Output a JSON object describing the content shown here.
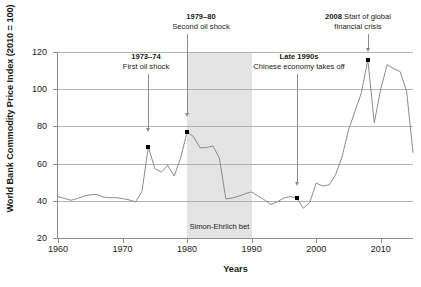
{
  "chart_data": {
    "type": "line",
    "title": "",
    "xlabel": "Years",
    "ylabel": "World Bank Commodity Price Index (2010 = 100)",
    "xlim": [
      1960,
      2015
    ],
    "ylim": [
      20,
      120
    ],
    "xticks": [
      1960,
      1970,
      1980,
      1990,
      2000,
      2010
    ],
    "yticks": [
      20,
      40,
      60,
      80,
      100,
      120
    ],
    "grid": "horizontal",
    "legend": "none",
    "series": [
      {
        "name": "World Bank Commodity Price Index",
        "color": "#8c8c8c",
        "x": [
          1960,
          1961,
          1962,
          1963,
          1964,
          1965,
          1966,
          1967,
          1968,
          1969,
          1970,
          1971,
          1972,
          1973,
          1974,
          1975,
          1976,
          1977,
          1978,
          1979,
          1980,
          1981,
          1982,
          1983,
          1984,
          1985,
          1986,
          1987,
          1988,
          1989,
          1990,
          1991,
          1992,
          1993,
          1994,
          1995,
          1996,
          1997,
          1998,
          1999,
          2000,
          2001,
          2002,
          2003,
          2004,
          2005,
          2006,
          2007,
          2008,
          2009,
          2010,
          2011,
          2012,
          2013,
          2014,
          2015
        ],
        "y": [
          42.2,
          41.3,
          40.3,
          41.2,
          42.5,
          43.3,
          43.4,
          42.0,
          41.6,
          41.7,
          41.2,
          40.5,
          39.4,
          45.0,
          69.0,
          57.3,
          55.5,
          59.0,
          53.3,
          63.0,
          77.0,
          74.5,
          68.5,
          68.6,
          69.5,
          63.0,
          41.0,
          41.5,
          42.5,
          43.8,
          44.8,
          42.5,
          40.5,
          38.0,
          39.5,
          41.5,
          42.3,
          41.5,
          36.0,
          39.0,
          49.5,
          48.0,
          48.5,
          54.0,
          63.5,
          78.0,
          88.0,
          98.0,
          115.8,
          82.0,
          100.0,
          113.2,
          111.0,
          109.5,
          99.0,
          66.0
        ]
      }
    ],
    "markers": [
      {
        "x": 1974,
        "y": 69.0,
        "label": "1973-74 peak"
      },
      {
        "x": 1980,
        "y": 77.0,
        "label": "1979-80 peak"
      },
      {
        "x": 1997,
        "y": 41.5,
        "label": "late 1990s low"
      },
      {
        "x": 2008,
        "y": 115.8,
        "label": "2008 peak"
      }
    ],
    "shaded_regions": [
      {
        "name": "Simon-Ehrlich bet",
        "x_start": 1980,
        "x_end": 1990,
        "color": "#e4e4e4",
        "label": "Simon-Ehrlich bet"
      }
    ],
    "annotations": [
      {
        "id": "first-oil-shock",
        "bold": "1973–74",
        "text": "First oil shock",
        "target_x": 1974,
        "target_y": 77
      },
      {
        "id": "second-oil-shock",
        "bold": "1979–80",
        "text": "Second oil shock",
        "target_x": 1980,
        "target_y": 85
      },
      {
        "id": "chinese-economy",
        "bold": "Late 1990s",
        "text": "Chinese economy takes off",
        "target_x": 1997,
        "target_y": 48
      },
      {
        "id": "financial-crisis",
        "bold": "2008",
        "text": "Start of global financial crisis",
        "target_x": 2008,
        "target_y": 120
      }
    ]
  },
  "axis": {
    "ylabel": "World Bank Commodity Price Index (2010 = 100)",
    "xlabel": "Years",
    "yticks": [
      "120",
      "100",
      "80",
      "60",
      "40",
      "20"
    ],
    "xticks": [
      "1960",
      "1970",
      "1980",
      "1990",
      "2000",
      "2010"
    ]
  },
  "annotations": {
    "first_oil_shock": {
      "bold": "1973–74",
      "text": "First oil shock"
    },
    "second_oil_shock": {
      "bold": "1979–80",
      "text": "Second oil shock"
    },
    "chinese_economy": {
      "bold": "Late 1990s",
      "text": "Chinese economy takes off"
    },
    "financial_crisis": {
      "bold": "2008",
      "text": "Start of global financial crisis"
    },
    "band_label": "Simon-Ehrlich bet"
  },
  "colors": {
    "line": "#8c8c8c",
    "grid": "#b2b2b2",
    "axis": "#8c8c8c",
    "band": "#e4e4e4",
    "marker": "#000000",
    "text": "#1a1a1a"
  }
}
